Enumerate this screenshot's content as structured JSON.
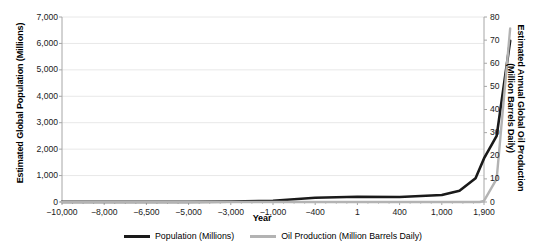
{
  "chart_data": {
    "type": "line",
    "title": "",
    "xlabel": "Year",
    "ylabel": "Estimated Global Population (Millions)",
    "y2label_line1": "Estimated Annual Global Oil Production",
    "y2label_line2": "(Million Barrels Daily)",
    "grid": true,
    "legend_position": "bottom",
    "categories": [
      "-10,000",
      "-8,000",
      "-6,500",
      "-5,000",
      "-3,000",
      "-1,000",
      "-400",
      "1",
      "400",
      "1,000",
      "1,900"
    ],
    "x_tick_labels": [
      "−10,000",
      "−8,000",
      "−6,500",
      "−5,000",
      "−3,000",
      "−1,000",
      "−400",
      "1",
      "400",
      "1,000",
      "1,900"
    ],
    "y_tick_labels": [
      "0",
      "1,000",
      "2,000",
      "3,000",
      "4,000",
      "5,000",
      "6,000",
      "7,000"
    ],
    "y_values": [
      0,
      1000,
      2000,
      3000,
      4000,
      5000,
      6000,
      7000
    ],
    "ylim": [
      0,
      7000
    ],
    "y2_tick_labels": [
      "0",
      "10",
      "20",
      "30",
      "40",
      "50",
      "60",
      "70",
      "80"
    ],
    "y2_values": [
      0,
      10,
      20,
      30,
      40,
      50,
      60,
      70,
      80
    ],
    "y2lim": [
      0,
      80
    ],
    "series": [
      {
        "name": "Population (Millions)",
        "color": "#1a1a1a",
        "axis": "left",
        "x": [
          "-10,000",
          "-8,000",
          "-6,500",
          "-5,000",
          "-3,000",
          "-1,000",
          "-400",
          "1",
          "400",
          "1,000",
          "1,500",
          "1,800",
          "1,900",
          "1,950",
          "2,000"
        ],
        "values": [
          4,
          5,
          5,
          5,
          14,
          50,
          162,
          200,
          190,
          265,
          425,
          900,
          1650,
          2500,
          6100
        ]
      },
      {
        "name": "Oil Production (Million Barrels Daily)",
        "color": "#b3b3b3",
        "axis": "right",
        "x": [
          "-10,000",
          "1",
          "1,000",
          "1,850",
          "1,900",
          "1,950",
          "2,000"
        ],
        "values": [
          0,
          0,
          0,
          0,
          0.5,
          10,
          75
        ]
      }
    ]
  },
  "legend": {
    "entries": [
      {
        "label": "Population (Millions)",
        "color": "#1a1a1a"
      },
      {
        "label": "Oil Production (Million Barrels Daily)",
        "color": "#b3b3b3"
      }
    ]
  },
  "colors": {
    "population_line": "#1a1a1a",
    "oil_line": "#b3b3b3",
    "gridline": "#e8e8e8",
    "axis": "#a6a6a6",
    "text": "#1a1a1a",
    "background": "#ffffff"
  }
}
